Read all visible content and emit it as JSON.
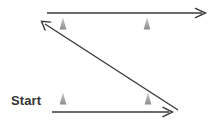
{
  "diagram": {
    "title": "Start",
    "canvas": {
      "width": 214,
      "height": 122,
      "background": "#ffffff"
    },
    "labels": [
      {
        "name": "start-label",
        "text": "Start",
        "x": 11,
        "y": 93,
        "color": "#333333",
        "font_size": 13
      }
    ],
    "stroke_color": "#3a3a3a",
    "stroke_width": 1.4,
    "marker_color": "#9d9d9d",
    "arrows": [
      {
        "name": "top-arrow",
        "label": "top horizontal arrow pointing right",
        "x1": 47,
        "y1": 13,
        "x2": 205,
        "y2": 13,
        "direction": "right",
        "arrowhead_at": "end"
      },
      {
        "name": "diagonal-arrow",
        "label": "diagonal arrow pointing up-left",
        "x1": 178,
        "y1": 110,
        "x2": 42,
        "y2": 22,
        "direction": "up-left",
        "arrowhead_at": "end"
      },
      {
        "name": "bottom-arrow",
        "label": "bottom horizontal arrow pointing right",
        "x1": 52,
        "y1": 112,
        "x2": 172,
        "y2": 112,
        "direction": "right",
        "arrowhead_at": "end"
      }
    ],
    "markers": [
      {
        "name": "marker-top-left",
        "x": 63,
        "y": 25,
        "color": "#9d9d9d"
      },
      {
        "name": "marker-top-right",
        "x": 147,
        "y": 25,
        "color": "#9d9d9d"
      },
      {
        "name": "marker-bottom-left",
        "x": 63,
        "y": 100,
        "color": "#9d9d9d"
      },
      {
        "name": "marker-bottom-right",
        "x": 148,
        "y": 100,
        "color": "#9d9d9d"
      }
    ]
  }
}
